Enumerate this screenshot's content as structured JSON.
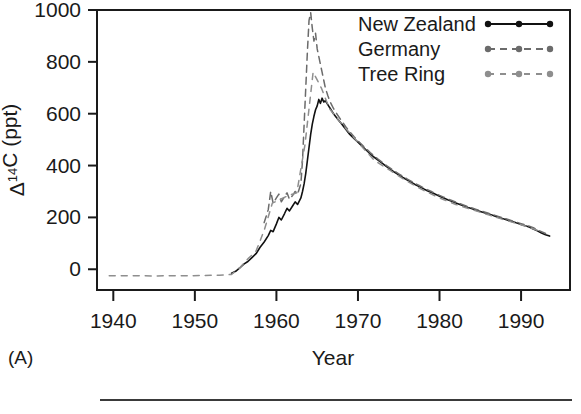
{
  "panel": {
    "label": "(A)"
  },
  "axes": {
    "ylabel_delta": "Δ",
    "ylabel_sup": "14",
    "ylabel_rest": "C (ppt)",
    "ylabel_full": "Δ14C (ppt)",
    "xlabel": "Year",
    "ytick_labels": [
      "0",
      "200",
      "400",
      "600",
      "800",
      "1000"
    ],
    "xtick_labels": [
      "1940",
      "1950",
      "1960",
      "1970",
      "1980",
      "1990"
    ]
  },
  "legend": {
    "items": [
      {
        "label": "New Zealand",
        "style": "solid",
        "color": "#111111"
      },
      {
        "label": "Germany",
        "style": "dashed",
        "color": "#6b6b6b"
      },
      {
        "label": "Tree Ring",
        "style": "dotted",
        "color": "#8e8e8e"
      }
    ]
  },
  "colors": {
    "new_zealand": "#111111",
    "germany": "#6b6b6b",
    "tree_ring": "#8e8e8e",
    "frame": "#1a1a1a",
    "background": "#ffffff"
  },
  "chart_data": {
    "type": "line",
    "title": "",
    "xlabel": "Year",
    "ylabel": "Δ14C (ppt)",
    "xlim": [
      1938,
      1996
    ],
    "ylim": [
      -80,
      1000
    ],
    "xticks": [
      1940,
      1950,
      1960,
      1970,
      1980,
      1990
    ],
    "yticks": [
      0,
      200,
      400,
      600,
      800,
      1000
    ],
    "grid": false,
    "legend_position": "top-right",
    "annotations": [
      "(A)"
    ],
    "series": [
      {
        "name": "New Zealand",
        "style": "solid",
        "color": "#111111",
        "x": [
          1954.5,
          1955.0,
          1955.5,
          1956.0,
          1956.5,
          1957.0,
          1957.5,
          1958.0,
          1958.5,
          1959.0,
          1959.3,
          1959.6,
          1960.0,
          1960.3,
          1960.6,
          1961.0,
          1961.3,
          1961.6,
          1962.0,
          1962.3,
          1962.6,
          1963.0,
          1963.2,
          1963.4,
          1963.6,
          1963.8,
          1964.0,
          1964.2,
          1964.4,
          1964.6,
          1964.8,
          1965.0,
          1965.2,
          1965.4,
          1965.6,
          1965.8,
          1966.0,
          1966.3,
          1966.6,
          1967.0,
          1967.5,
          1968.0,
          1968.5,
          1969.0,
          1969.5,
          1970.0,
          1970.5,
          1971.0,
          1971.5,
          1972.0,
          1972.5,
          1973.0,
          1973.5,
          1974.0,
          1974.5,
          1975.0,
          1975.5,
          1976.0,
          1976.5,
          1977.0,
          1977.5,
          1978.0,
          1978.5,
          1979.0,
          1979.5,
          1980.0,
          1980.5,
          1981.0,
          1981.5,
          1982.0,
          1982.5,
          1983.0,
          1983.5,
          1984.0,
          1984.5,
          1985.0,
          1985.5,
          1986.0,
          1986.5,
          1987.0,
          1987.5,
          1988.0,
          1988.5,
          1989.0,
          1989.5,
          1990.0,
          1990.5,
          1991.0,
          1991.5,
          1992.0,
          1992.5,
          1993.0,
          1993.5
        ],
        "y": [
          -15,
          -8,
          5,
          20,
          30,
          45,
          60,
          85,
          105,
          130,
          150,
          145,
          175,
          200,
          190,
          215,
          235,
          225,
          245,
          260,
          250,
          275,
          300,
          330,
          370,
          420,
          470,
          520,
          560,
          590,
          615,
          630,
          655,
          640,
          660,
          645,
          650,
          635,
          620,
          600,
          580,
          560,
          540,
          520,
          505,
          490,
          475,
          460,
          445,
          432,
          420,
          408,
          396,
          385,
          374,
          364,
          354,
          345,
          336,
          327,
          319,
          311,
          303,
          296,
          289,
          282,
          275,
          268,
          262,
          256,
          250,
          244,
          238,
          233,
          228,
          223,
          218,
          213,
          208,
          203,
          198,
          193,
          188,
          183,
          178,
          173,
          168,
          163,
          155,
          148,
          140,
          133,
          128
        ]
      },
      {
        "name": "Germany",
        "style": "dashed",
        "color": "#6b6b6b",
        "x": [
          1958.5,
          1959.0,
          1959.3,
          1959.6,
          1960.0,
          1960.3,
          1960.6,
          1961.0,
          1961.3,
          1961.6,
          1962.0,
          1962.3,
          1962.6,
          1963.0,
          1963.2,
          1963.4,
          1963.6,
          1963.8,
          1964.0,
          1964.2,
          1964.4,
          1964.6,
          1964.8,
          1965.0,
          1965.2,
          1965.4,
          1965.6,
          1965.8,
          1966.0,
          1966.3,
          1966.6,
          1967.0,
          1967.5,
          1968.0,
          1968.5,
          1969.0,
          1969.5,
          1970.0,
          1970.5,
          1971.0,
          1971.5,
          1972.0,
          1972.5,
          1973.0,
          1973.5,
          1974.0,
          1974.5,
          1975.0,
          1975.5,
          1976.0,
          1976.5,
          1977.0,
          1977.5,
          1978.0,
          1978.5,
          1979.0,
          1979.5,
          1980.0,
          1980.5,
          1981.0,
          1981.5,
          1982.0,
          1982.5,
          1983.0,
          1983.5,
          1984.0,
          1984.5,
          1985.0,
          1985.5,
          1986.0,
          1986.5,
          1987.0,
          1987.5,
          1988.0,
          1988.5,
          1989.0,
          1989.5,
          1990.0,
          1990.5,
          1991.0,
          1991.5,
          1992.0,
          1992.5,
          1993.0
        ],
        "y": [
          180,
          230,
          300,
          255,
          275,
          290,
          260,
          280,
          295,
          270,
          285,
          300,
          290,
          330,
          420,
          560,
          700,
          840,
          960,
          990,
          930,
          880,
          910,
          850,
          820,
          790,
          760,
          730,
          700,
          670,
          645,
          620,
          595,
          572,
          550,
          530,
          512,
          495,
          480,
          465,
          450,
          437,
          424,
          412,
          400,
          389,
          378,
          368,
          358,
          349,
          340,
          331,
          323,
          315,
          307,
          300,
          292,
          285,
          278,
          271,
          265,
          259,
          253,
          247,
          241,
          236,
          231,
          226,
          221,
          216,
          211,
          206,
          201,
          196,
          191,
          186,
          181,
          176,
          171,
          166,
          160,
          152,
          145,
          138
        ]
      },
      {
        "name": "Tree Ring",
        "style": "dotted",
        "color": "#8e8e8e",
        "x": [
          1939.5,
          1941,
          1943,
          1945,
          1947,
          1949,
          1951,
          1953,
          1954.5,
          1955.5,
          1956.5,
          1957.5,
          1958.5,
          1959.5,
          1960.5,
          1961.5,
          1962.5,
          1963.5,
          1964.5,
          1965.5,
          1966.5,
          1968,
          1970,
          1972,
          1974,
          1976,
          1978,
          1980,
          1982,
          1984,
          1986,
          1988,
          1990,
          1992
        ],
        "y": [
          -25,
          -25,
          -25,
          -26,
          -25,
          -25,
          -24,
          -23,
          -20,
          5,
          40,
          70,
          150,
          255,
          270,
          285,
          295,
          480,
          760,
          700,
          620,
          560,
          490,
          420,
          380,
          340,
          305,
          275,
          250,
          230,
          210,
          190,
          172,
          150
        ]
      }
    ]
  }
}
